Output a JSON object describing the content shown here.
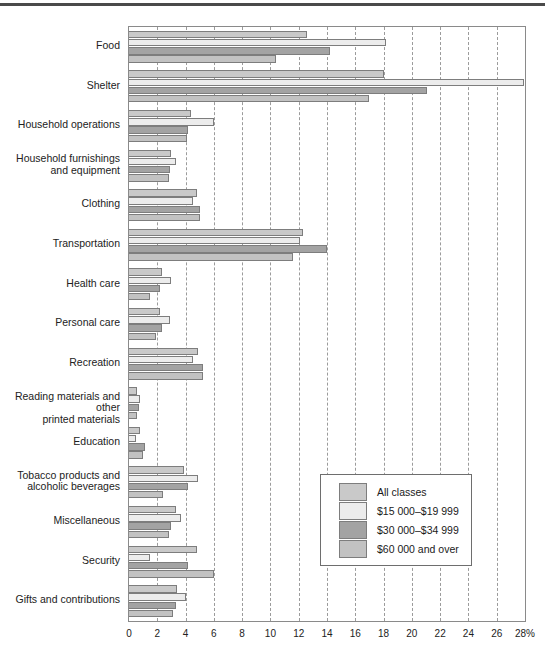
{
  "chart_data": {
    "type": "bar",
    "orientation": "horizontal",
    "title": "",
    "xlabel": "",
    "ylabel": "",
    "xlim": [
      0,
      28
    ],
    "xtick_labels": [
      "0",
      "2",
      "4",
      "6",
      "8",
      "10",
      "12",
      "14",
      "16",
      "18",
      "20",
      "22",
      "24",
      "26",
      "28%"
    ],
    "xtick_values": [
      0,
      2,
      4,
      6,
      8,
      10,
      12,
      14,
      16,
      18,
      20,
      22,
      24,
      26,
      28
    ],
    "grid": true,
    "grid_style": "dashed-vertical",
    "legend_position": "inside-lower-right",
    "categories": [
      "Food",
      "Shelter",
      "Household operations",
      "Household furnishings\nand equipment",
      "Clothing",
      "Transportation",
      "Health care",
      "Personal care",
      "Recreation",
      "Reading materials and other\nprinted materials",
      "Education",
      "Tobacco products and\nalcoholic beverages",
      "Miscellaneous",
      "Security",
      "Gifts and contributions"
    ],
    "series": [
      {
        "name": "All classes",
        "color": "#c9c9c9",
        "values": [
          12.6,
          18.0,
          4.4,
          3.0,
          4.8,
          12.3,
          2.3,
          2.2,
          4.9,
          0.6,
          0.8,
          3.9,
          3.3,
          4.8,
          3.4
        ]
      },
      {
        "name": "$15 000–$19 999",
        "color": "#ececec",
        "values": [
          18.2,
          27.9,
          6.0,
          3.3,
          4.5,
          12.1,
          3.0,
          2.9,
          4.5,
          0.75,
          0.5,
          4.9,
          3.7,
          1.5,
          4.0
        ]
      },
      {
        "name": "$30 000–$34 999",
        "color": "#a3a3a3",
        "values": [
          14.2,
          21.1,
          4.2,
          2.9,
          5.0,
          14.0,
          2.2,
          2.3,
          5.2,
          0.7,
          1.1,
          4.2,
          3.0,
          4.2,
          3.3
        ]
      },
      {
        "name": "$60 000 and over",
        "color": "#c2c2c2",
        "values": [
          10.4,
          17.0,
          4.1,
          2.8,
          5.0,
          11.6,
          1.5,
          1.9,
          5.2,
          0.55,
          1.0,
          2.4,
          2.8,
          6.0,
          3.1
        ]
      }
    ]
  },
  "legend": {
    "entries": [
      {
        "label": "All classes",
        "color": "#c9c9c9"
      },
      {
        "label": "$15 000–$19 999",
        "color": "#ececec"
      },
      {
        "label": "$30 000–$34 999",
        "color": "#a3a3a3"
      },
      {
        "label": "$60 000 and over",
        "color": "#c2c2c2"
      }
    ]
  }
}
